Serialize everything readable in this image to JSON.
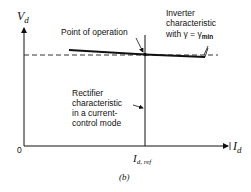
{
  "figure": {
    "caption": "(b)",
    "axes": {
      "y_label": "V",
      "y_label_sub": "d",
      "x_label": "I",
      "x_label_sub": "d",
      "origin_label": "0",
      "x_tick_label": "I",
      "x_tick_label_sub": "d, ref"
    },
    "annotations": {
      "point_of_operation": "Point of operation",
      "inverter_line1": "Inverter",
      "inverter_line2": "characteristic",
      "inverter_line3_prefix": "with γ = γ",
      "inverter_line3_sub": "min",
      "rectifier_line1": "Rectifier",
      "rectifier_line2": "characteristic",
      "rectifier_line3": "in a current-",
      "rectifier_line4": "control mode"
    }
  }
}
